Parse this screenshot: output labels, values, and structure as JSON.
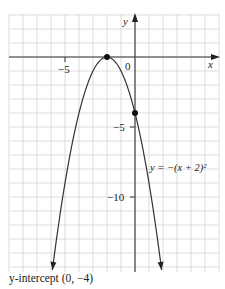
{
  "chart_data": {
    "type": "line",
    "title": "",
    "equation_label": "y = −(x + 2)²",
    "xlabel": "x",
    "ylabel": "y",
    "xlim": [
      -9,
      6
    ],
    "ylim": [
      -15.4,
      3
    ],
    "grid": true,
    "grid_step": 1,
    "x_ticks_labeled": [
      {
        "value": -5,
        "label": "−5"
      },
      {
        "value": 0,
        "label": "0"
      }
    ],
    "y_ticks_labeled": [
      {
        "value": -5,
        "label": "−5"
      },
      {
        "value": -10,
        "label": "−10"
      }
    ],
    "series": [
      {
        "name": "y = −(x + 2)²",
        "function": "-(x+2)^2",
        "x_range": [
          -5.9,
          1.9
        ],
        "arrows_at_ends": true,
        "sample_points": [
          {
            "x": -5.9,
            "y": -15.2
          },
          {
            "x": -5,
            "y": -9
          },
          {
            "x": -4,
            "y": -4
          },
          {
            "x": -3,
            "y": -1
          },
          {
            "x": -2,
            "y": 0
          },
          {
            "x": -1,
            "y": -1
          },
          {
            "x": 0,
            "y": -4
          },
          {
            "x": 1,
            "y": -9
          },
          {
            "x": 1.9,
            "y": -15.2
          }
        ]
      }
    ],
    "highlighted_points": [
      {
        "name": "vertex",
        "x": -2,
        "y": 0
      },
      {
        "name": "y-intercept",
        "x": 0,
        "y": -4
      }
    ],
    "annotations": [
      "y-intercept (0, −4)"
    ]
  },
  "axis": {
    "x_label": "x",
    "y_label": "y"
  },
  "ticks": {
    "x_neg5": "−5",
    "origin": "0",
    "y_neg5": "−5",
    "y_neg10": "−10"
  },
  "labels": {
    "equation": "y = −(x + 2)²"
  },
  "caption": "y-intercept (0, −4)"
}
